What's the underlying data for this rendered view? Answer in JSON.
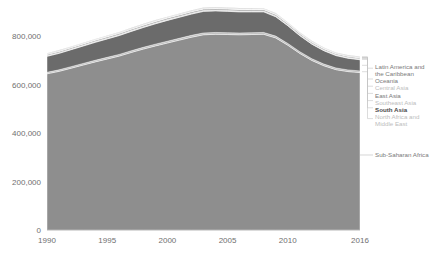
{
  "chart_data": {
    "type": "area",
    "stacked": true,
    "title": "",
    "subtitle": "",
    "xlabel": "",
    "ylabel": "",
    "xlim": [
      1990,
      2016
    ],
    "ylim": [
      0,
      900000
    ],
    "grid": false,
    "legend_position": "right",
    "x": [
      1990,
      1991,
      1992,
      1993,
      1994,
      1995,
      1996,
      1997,
      1998,
      1999,
      2000,
      2001,
      2002,
      2003,
      2004,
      2005,
      2006,
      2007,
      2008,
      2009,
      2010,
      2011,
      2012,
      2013,
      2014,
      2015,
      2016
    ],
    "y_ticks": [
      0,
      200000,
      400000,
      600000,
      800000
    ],
    "y_tick_labels": [
      "0",
      "200,000",
      "400,000",
      "600,000",
      "800,000"
    ],
    "x_ticks": [
      1990,
      1995,
      2000,
      2005,
      2010,
      2016
    ],
    "x_tick_labels": [
      "1990",
      "1995",
      "2000",
      "2005",
      "2010",
      "2016"
    ],
    "series": [
      {
        "name": "Sub-Saharan Africa",
        "color": "#8e8e8e",
        "values": [
          645000,
          655000,
          668000,
          681000,
          694000,
          706000,
          718000,
          733000,
          747000,
          760000,
          772000,
          784000,
          796000,
          806000,
          808000,
          807000,
          806000,
          807000,
          808000,
          793000,
          763000,
          729000,
          700000,
          678000,
          662000,
          654000,
          650000
        ]
      },
      {
        "name": "North Africa and Middle East",
        "color": "#bdbdbd",
        "values": [
          6000,
          6200,
          6400,
          6500,
          6600,
          6800,
          6900,
          7000,
          7100,
          7200,
          7300,
          7400,
          7500,
          7600,
          7600,
          7600,
          7600,
          7600,
          7600,
          7500,
          7400,
          7300,
          7200,
          7100,
          7000,
          7000,
          6900
        ]
      },
      {
        "name": "South Asia",
        "color": "#6b6b6b",
        "values": [
          66000,
          68000,
          70000,
          72000,
          74000,
          76000,
          78000,
          80000,
          82000,
          84000,
          86000,
          87000,
          88000,
          89000,
          89000,
          88000,
          87000,
          86000,
          85000,
          80000,
          73000,
          66000,
          60000,
          55000,
          51000,
          48000,
          46000
        ]
      },
      {
        "name": "Southeast Asia",
        "color": "#cfcfcf",
        "values": [
          3000,
          3050,
          3100,
          3150,
          3200,
          3250,
          3300,
          3350,
          3400,
          3450,
          3500,
          3520,
          3540,
          3560,
          3560,
          3540,
          3520,
          3500,
          3480,
          3400,
          3300,
          3200,
          3100,
          3050,
          3000,
          2950,
          2900
        ]
      },
      {
        "name": "East Asia",
        "color": "#a6a6a6",
        "values": [
          5000,
          5100,
          5200,
          5300,
          5400,
          5500,
          5600,
          5700,
          5800,
          5900,
          6000,
          6050,
          6100,
          6150,
          6150,
          6100,
          6050,
          6000,
          5950,
          5800,
          5600,
          5400,
          5200,
          5050,
          4950,
          4900,
          4850
        ]
      },
      {
        "name": "Central Asia",
        "color": "#d8d8d8",
        "values": [
          1800,
          1820,
          1840,
          1860,
          1880,
          1900,
          1920,
          1940,
          1960,
          1980,
          2000,
          2010,
          2020,
          2030,
          2030,
          2020,
          2010,
          2000,
          1990,
          1950,
          1900,
          1850,
          1800,
          1780,
          1760,
          1750,
          1740
        ]
      },
      {
        "name": "Oceania",
        "color": "#9a9a9a",
        "values": [
          1200,
          1220,
          1240,
          1260,
          1280,
          1300,
          1320,
          1340,
          1360,
          1380,
          1400,
          1410,
          1420,
          1430,
          1430,
          1420,
          1410,
          1400,
          1390,
          1360,
          1330,
          1300,
          1270,
          1255,
          1245,
          1240,
          1235
        ]
      },
      {
        "name": "Latin America and the Caribbean",
        "color": "#b5b5b5",
        "values": [
          2200,
          2240,
          2280,
          2320,
          2360,
          2400,
          2440,
          2480,
          2520,
          2560,
          2600,
          2620,
          2640,
          2660,
          2660,
          2640,
          2620,
          2600,
          2580,
          2520,
          2460,
          2400,
          2340,
          2310,
          2290,
          2280,
          2270
        ]
      }
    ],
    "legend_entries": [
      {
        "label_lines": [
          "Latin America and",
          "the Caribbean"
        ],
        "color": "#b5b5b5",
        "emphasis": "normal"
      },
      {
        "label_lines": [
          "Oceania"
        ],
        "color": "#9a9a9a",
        "emphasis": "normal"
      },
      {
        "label_lines": [
          "Central Asia"
        ],
        "color": "#d8d8d8",
        "emphasis": "faint"
      },
      {
        "label_lines": [
          "East Asia"
        ],
        "color": "#a6a6a6",
        "emphasis": "normal"
      },
      {
        "label_lines": [
          "Southeast Asia"
        ],
        "color": "#cfcfcf",
        "emphasis": "faint"
      },
      {
        "label_lines": [
          "South Asia"
        ],
        "color": "#6b6b6b",
        "emphasis": "bold"
      },
      {
        "label_lines": [
          "North Africa and",
          "Middle East"
        ],
        "color": "#bdbdbd",
        "emphasis": "faint"
      },
      {
        "label_lines": [
          "Sub-Saharan Africa"
        ],
        "color": "#8e8e8e",
        "emphasis": "normal"
      }
    ]
  },
  "colors": {
    "axis_text": "#6f6f6f",
    "legend_normal": "#7a7a7a",
    "legend_faint": "#bdbdbd",
    "legend_bold": "#4a4a4a",
    "leader_line": "#c4c4c4",
    "background": "#ffffff"
  }
}
